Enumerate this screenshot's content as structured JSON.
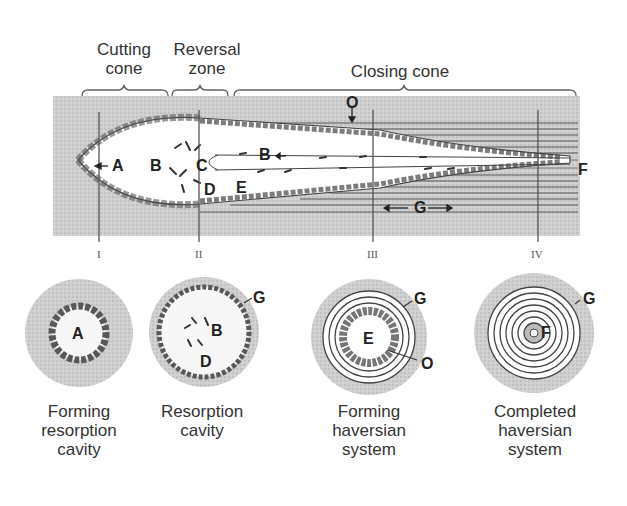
{
  "diagram": {
    "top_labels": [
      {
        "id": "cutting-cone",
        "line1": "Cutting",
        "line2": "cone"
      },
      {
        "id": "reversal-zone",
        "line1": "Reversal",
        "line2": "zone"
      },
      {
        "id": "closing-cone",
        "line1": "Closing cone"
      }
    ],
    "longitudinal_letters": {
      "A": "A",
      "B1": "B",
      "C": "C",
      "B2": "B",
      "D": "D",
      "E": "E",
      "O": "O",
      "F": "F",
      "G": "G"
    },
    "section_markers": [
      "I",
      "II",
      "III",
      "IV"
    ],
    "cross_sections": [
      {
        "id": "forming-resorption-cavity",
        "letters": [
          "A"
        ],
        "caption": [
          "Forming",
          "resorption",
          "cavity"
        ]
      },
      {
        "id": "resorption-cavity",
        "letters": [
          "B",
          "D",
          "G"
        ],
        "caption": [
          "Resorption",
          "cavity"
        ]
      },
      {
        "id": "forming-haversian-system",
        "letters": [
          "E",
          "G",
          "O"
        ],
        "caption": [
          "Forming",
          "haversian",
          "system"
        ]
      },
      {
        "id": "completed-haversian-system",
        "letters": [
          "F",
          "G"
        ],
        "caption": [
          "Completed",
          "haversian",
          "system"
        ]
      }
    ]
  }
}
